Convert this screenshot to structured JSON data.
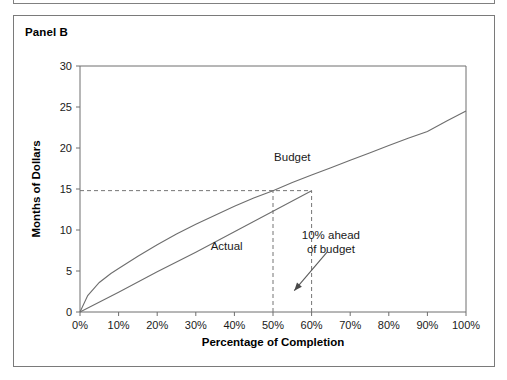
{
  "panel": {
    "title": "Panel B"
  },
  "chart_data": {
    "type": "line",
    "title": "Panel B",
    "xlabel": "Percentage of Completion",
    "ylabel": "Months of Dollars",
    "xlim": [
      0,
      100
    ],
    "ylim": [
      0,
      30
    ],
    "xticks": [
      0,
      10,
      20,
      30,
      40,
      50,
      60,
      70,
      80,
      90,
      100
    ],
    "xtick_labels": [
      "0%",
      "10%",
      "20%",
      "30%",
      "40%",
      "50%",
      "60%",
      "70%",
      "80%",
      "90%",
      "100%"
    ],
    "yticks": [
      0,
      5,
      10,
      15,
      20,
      25,
      30
    ],
    "ytick_labels": [
      "0",
      "5",
      "10",
      "15",
      "20",
      "25",
      "30"
    ],
    "grid": false,
    "legend": "inline-labels",
    "series": [
      {
        "name": "Budget",
        "label": "Budget",
        "label_x": 55,
        "label_y": 18.4,
        "x": [
          0,
          2,
          5,
          8,
          10,
          15,
          20,
          25,
          30,
          35,
          40,
          45,
          50,
          55,
          60,
          65,
          70,
          75,
          80,
          85,
          90,
          95,
          100
        ],
        "y": [
          0,
          2.0,
          3.6,
          4.7,
          5.3,
          6.8,
          8.2,
          9.5,
          10.7,
          11.8,
          12.9,
          13.9,
          14.8,
          15.8,
          16.7,
          17.6,
          18.5,
          19.4,
          20.3,
          21.2,
          22.0,
          23.3,
          24.5
        ]
      },
      {
        "name": "Actual",
        "label": "Actual",
        "label_x": 38,
        "label_y": 7.6,
        "x": [
          0,
          10,
          20,
          30,
          40,
          50,
          60
        ],
        "y": [
          0,
          2.4,
          4.9,
          7.3,
          9.8,
          12.3,
          14.8
        ]
      }
    ],
    "annotations": [
      {
        "name": "ahead-of-budget-callout",
        "text_lines": [
          "10% ahead",
          "of budget"
        ],
        "text_x": 65,
        "text_y": 8.9,
        "arrow_from_x": 64,
        "arrow_from_y": 7.3,
        "arrow_to_x": 55.5,
        "arrow_to_y": 2.6
      }
    ],
    "guides": [
      {
        "name": "horizontal-15-months-guide",
        "orientation": "horizontal",
        "value": 14.8,
        "from": 0,
        "to": 60,
        "style": "dashed"
      },
      {
        "name": "vertical-50-percent-guide",
        "orientation": "vertical",
        "value": 50,
        "from": 0,
        "to": 14.8,
        "style": "dashed"
      },
      {
        "name": "vertical-60-percent-guide",
        "orientation": "vertical",
        "value": 60,
        "from": 0,
        "to": 14.8,
        "style": "dashed"
      }
    ]
  }
}
